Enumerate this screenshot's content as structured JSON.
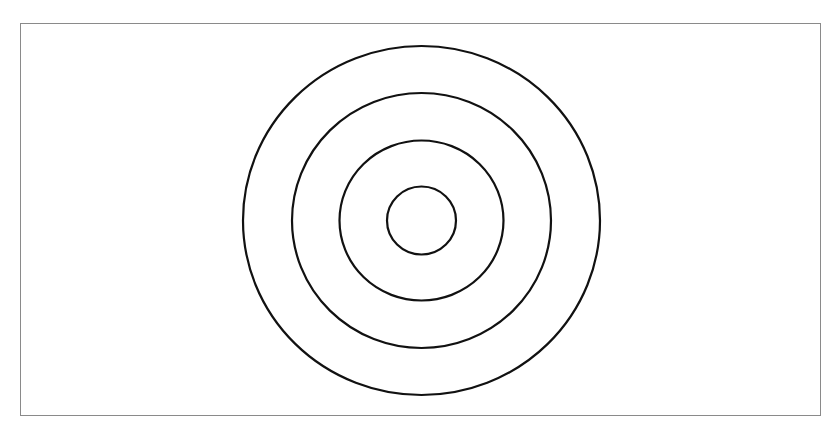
{
  "diagram": {
    "type": "concentric-circles",
    "frame": {
      "x": 20,
      "y": 23,
      "width": 801,
      "height": 393,
      "border_color": "#8a8a8a"
    },
    "center": {
      "x": 421.5,
      "y": 220.5
    },
    "stroke_color": "#111111",
    "stroke_width": 2.2,
    "rings": [
      {
        "name": "outer-ring",
        "rx": 178.5,
        "ry": 174.5
      },
      {
        "name": "third-ring",
        "rx": 129.5,
        "ry": 127.5
      },
      {
        "name": "second-ring",
        "rx": 82,
        "ry": 80
      },
      {
        "name": "inner-ring",
        "rx": 34.5,
        "ry": 34
      }
    ]
  }
}
